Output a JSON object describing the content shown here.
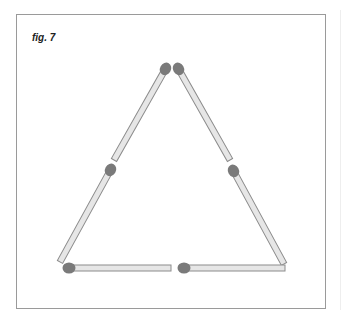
{
  "figure": {
    "caption": "fig. 7",
    "colors": {
      "frame_border": "#9a9a9a",
      "stick_fill": "#e6e6e6",
      "stick_outline": "#8c8c8c",
      "match_head": "#7a7a7a"
    },
    "matchsticks": [
      {
        "id": "left-upper",
        "head": [
          166,
          68
        ],
        "tail": [
          114,
          160
        ]
      },
      {
        "id": "left-lower",
        "head": [
          111,
          169
        ],
        "tail": [
          60,
          262
        ]
      },
      {
        "id": "right-upper",
        "head": [
          178,
          68
        ],
        "tail": [
          230,
          160
        ]
      },
      {
        "id": "right-lower",
        "head": [
          233,
          170
        ],
        "tail": [
          284,
          264
        ]
      },
      {
        "id": "bottom-left",
        "head": [
          68,
          268
        ],
        "tail": [
          171,
          268
        ]
      },
      {
        "id": "bottom-right",
        "head": [
          183,
          268
        ],
        "tail": [
          285,
          268
        ]
      }
    ]
  }
}
